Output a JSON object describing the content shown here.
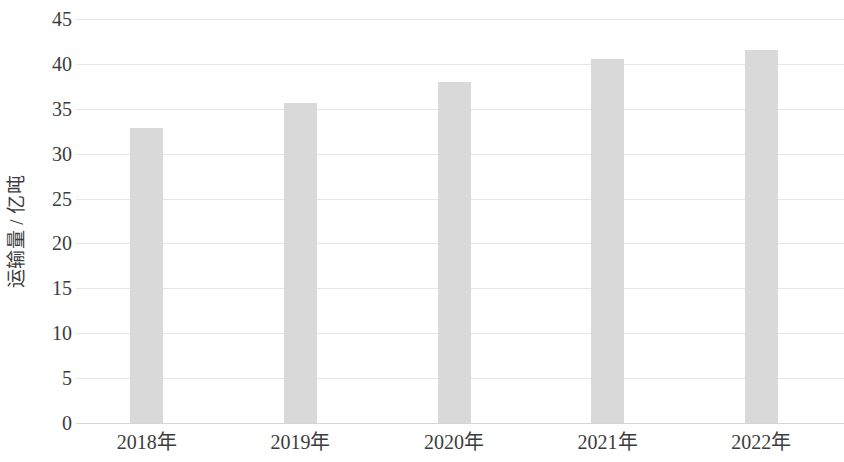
{
  "chart_data": {
    "type": "bar",
    "title": "",
    "subtitle": "",
    "xlabel": "",
    "ylabel": "运输量 / 亿吨",
    "categories": [
      "2018年",
      "2019年",
      "2020年",
      "2021年",
      "2022年"
    ],
    "values": [
      32.9,
      35.6,
      38.0,
      40.6,
      41.6
    ],
    "series": [
      {
        "name": "运输量",
        "values": [
          32.9,
          35.6,
          38.0,
          40.6,
          41.6
        ]
      }
    ],
    "ylim": [
      0,
      45
    ],
    "xlim": null,
    "y_ticks": [
      0,
      5,
      10,
      15,
      20,
      25,
      30,
      35,
      40,
      45
    ],
    "y_tick_labels": [
      "0",
      "5",
      "10",
      "15",
      "20",
      "25",
      "30",
      "35",
      "40",
      "45"
    ],
    "grid": true,
    "grid_axis": "y",
    "legend": false,
    "legend_position": "none",
    "annotations": [],
    "data_labels": false,
    "bar_color": "#d9d9d9",
    "grid_color": "#e4e7ea",
    "axis_color": "#d3d7da",
    "text_color": "#3c3c3c",
    "background_color": "#ffffff"
  }
}
